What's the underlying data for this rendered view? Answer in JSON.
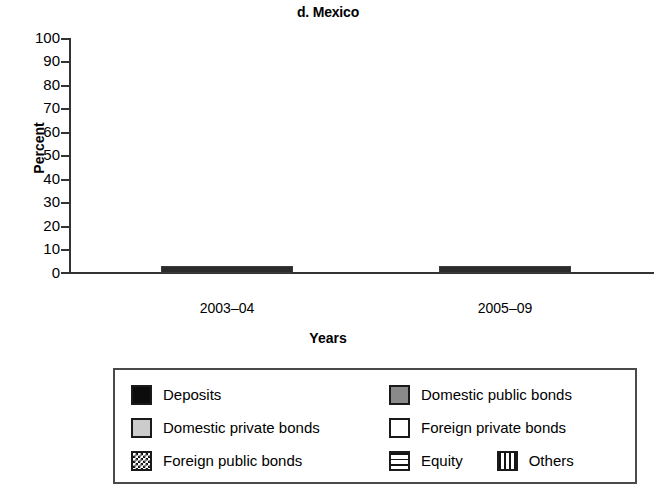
{
  "chart_data": {
    "type": "bar",
    "subtype": "stacked-bar-100",
    "title": "d. Mexico",
    "xlabel": "Years",
    "ylabel": "Percent",
    "ylim": [
      0,
      100
    ],
    "yticks": [
      0,
      10,
      20,
      30,
      40,
      50,
      60,
      70,
      80,
      90,
      100
    ],
    "ytick_labels": [
      "0",
      "10",
      "20",
      "30",
      "40",
      "50",
      "60",
      "70",
      "80",
      "90",
      "100"
    ],
    "grid": false,
    "legend_position": "below",
    "categories": [
      "2003–04",
      "2005–09"
    ],
    "series": [
      {
        "name": "Deposits",
        "pattern": "solid-black",
        "color": "#0c0c0c",
        "values": [
          14,
          13
        ]
      },
      {
        "name": "Domestic public bonds",
        "pattern": "solid-dark-gray",
        "color": "#8a8a8a",
        "values": [
          60,
          62
        ]
      },
      {
        "name": "Domestic private bonds",
        "pattern": "solid-light-gray",
        "color": "#cccccc",
        "values": [
          11,
          7
        ]
      },
      {
        "name": "Foreign private bonds",
        "pattern": "solid-white",
        "color": "#ffffff",
        "values": [
          0,
          0
        ]
      },
      {
        "name": "Foreign public bonds",
        "pattern": "checkerboard",
        "color": "#ffffff",
        "values": [
          1,
          1
        ]
      },
      {
        "name": "Equity",
        "pattern": "horizontal-lines",
        "color": "#ffffff",
        "values": [
          11,
          12
        ]
      },
      {
        "name": "Others",
        "pattern": "vertical-lines",
        "color": "#ffffff",
        "values": [
          3,
          5
        ]
      }
    ]
  },
  "legend": {
    "rows": [
      [
        {
          "label": "Deposits",
          "swatch": "solid-black"
        },
        {
          "label": "Domestic public bonds",
          "swatch": "solid-dark-gray"
        }
      ],
      [
        {
          "label": "Domestic private bonds",
          "swatch": "solid-light-gray"
        },
        {
          "label": "Foreign private bonds",
          "swatch": "solid-white"
        }
      ],
      [
        {
          "label": "Foreign public bonds",
          "swatch": "checkerboard"
        },
        {
          "label": "Equity",
          "swatch": "horizontal-lines"
        },
        {
          "label": "Others",
          "swatch": "vertical-lines"
        }
      ]
    ]
  }
}
